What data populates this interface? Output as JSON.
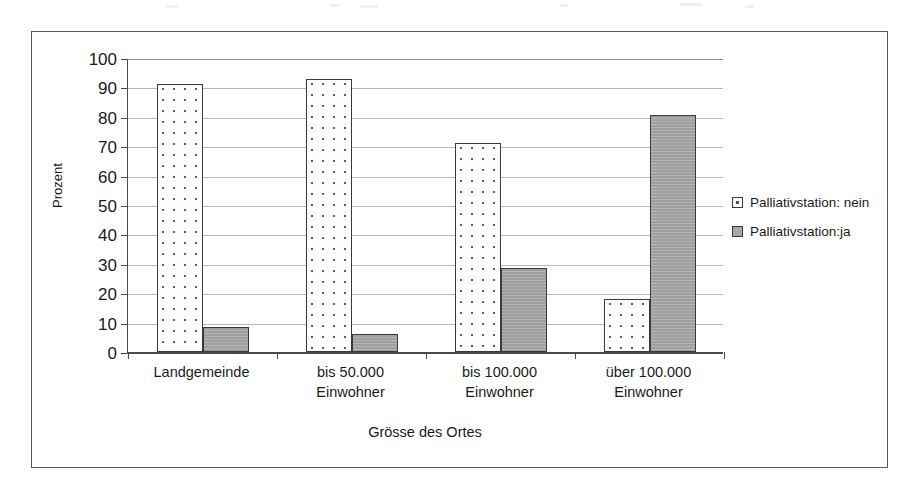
{
  "chart_data": {
    "type": "bar",
    "title": "",
    "xlabel": "Grösse des Ortes",
    "ylabel": "Prozent",
    "ylim": [
      0,
      100
    ],
    "ytick_step": 10,
    "yticks": [
      "100",
      "90",
      "80",
      "70",
      "60",
      "50",
      "40",
      "30",
      "20",
      "10",
      "0"
    ],
    "grid": true,
    "legend_position": "right",
    "categories": [
      "Landgemeinde",
      "bis 50.000 Einwohner",
      "bis 100.000 Einwohner",
      "über 100.000 Einwohner"
    ],
    "category_lines": [
      [
        "Landgemeinde"
      ],
      [
        "bis 50.000",
        "Einwohner"
      ],
      [
        "bis 100.000",
        "Einwohner"
      ],
      [
        "über 100.000",
        "Einwohner"
      ]
    ],
    "series": [
      {
        "name": "Palliativstation: nein",
        "fill": "dotted",
        "color": "#ffffff",
        "values": [
          91,
          93,
          71,
          18
        ]
      },
      {
        "name": "Palliativstation:ja",
        "fill": "solid-gray",
        "color": "#a8a8a8",
        "values": [
          8.5,
          6,
          28.5,
          80.5
        ]
      }
    ]
  },
  "legend": {
    "items": [
      {
        "label": "Palliativstation: nein",
        "swatch": "dotted-swatch"
      },
      {
        "label": "Palliativstation:ja",
        "swatch": "gray-swatch"
      }
    ]
  },
  "axes": {
    "y_title": "Prozent",
    "x_title": "Grösse des Ortes"
  }
}
